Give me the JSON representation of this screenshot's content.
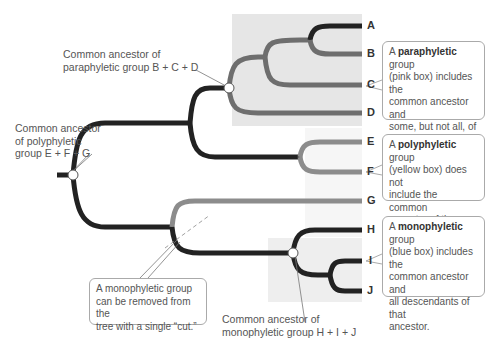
{
  "colors": {
    "dark_branch": "#222222",
    "gray_branch": "#6e6e6e",
    "light_branch": "#8c8c8c",
    "paraphyletic_box": "#e6e6e6",
    "polyphyletic_box": "#f6f6f6",
    "monophyletic_box": "#eeeeee"
  },
  "leaves": [
    "A",
    "B",
    "C",
    "D",
    "E",
    "F",
    "G",
    "H",
    "I",
    "J"
  ],
  "labels": {
    "para_ancestor_1": "Common ancestor of",
    "para_ancestor_2": "paraphyletic group B + C + D",
    "poly_ancestor_1": "Common ancestor",
    "poly_ancestor_2": "of polyphyletic",
    "poly_ancestor_3": "group E + F + G",
    "mono_ancestor_1": "Common ancestor of",
    "mono_ancestor_2": "monophyletic group H + I + J"
  },
  "callouts": {
    "paraphyletic": {
      "prefix": "A ",
      "term": "paraphyletic",
      "rest": " group",
      "lines": [
        "(pink box) includes the",
        "common ancestor and",
        "some, but not all, of the",
        "ancestor's decendants."
      ]
    },
    "polyphyletic": {
      "prefix": "A ",
      "term": "polyphyletic",
      "rest": " group",
      "lines": [
        "(yellow box) does not",
        "include the common",
        "ancestor of the group."
      ]
    },
    "monophyletic": {
      "prefix": "A ",
      "term": "monophyletic",
      "rest": " group",
      "lines": [
        "(blue box) includes the",
        "common ancestor and",
        "all descendants of that",
        "ancestor."
      ]
    },
    "cut": {
      "lines": [
        "A monophyletic group",
        "can be removed from the",
        "tree with a single “cut.”"
      ]
    }
  }
}
